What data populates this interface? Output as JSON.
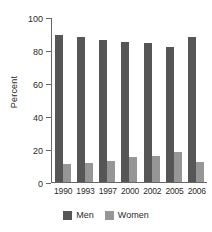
{
  "chart_data": {
    "type": "bar",
    "title": "",
    "xlabel": "",
    "ylabel": "Percent",
    "categories": [
      "1990",
      "1993",
      "1997",
      "2000",
      "2002",
      "2005",
      "2006"
    ],
    "series": [
      {
        "name": "Men",
        "color": "#565656",
        "values": [
          89,
          88,
          86,
          85,
          84,
          82,
          88
        ]
      },
      {
        "name": "Women",
        "color": "#969696",
        "values": [
          11,
          11.5,
          13,
          15,
          16,
          18,
          12
        ]
      }
    ],
    "ylim": [
      0,
      100
    ],
    "yticks": [
      0,
      20,
      40,
      60,
      80,
      100
    ],
    "ytick_labels": [
      "0",
      "20",
      "40",
      "60",
      "80",
      "100"
    ],
    "grid": false,
    "legend_position": "bottom-center"
  },
  "legend": {
    "items": [
      {
        "label": "Men"
      },
      {
        "label": "Women"
      }
    ]
  }
}
